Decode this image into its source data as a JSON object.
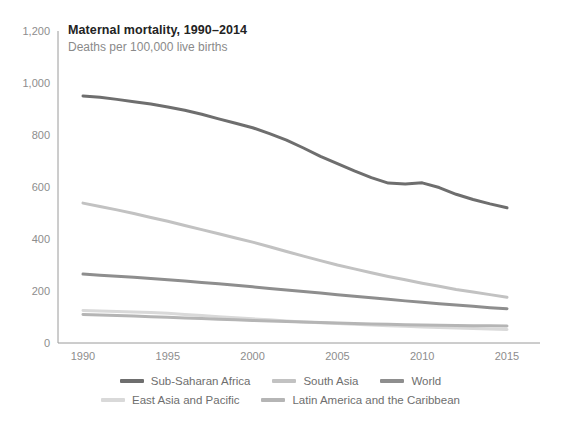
{
  "chart_data": {
    "type": "line",
    "title": "Maternal mortality, 1990–2014",
    "subtitle": "Deaths per 100,000 live births",
    "xlabel": "",
    "ylabel": "",
    "xlim": [
      1990,
      2015
    ],
    "ylim": [
      0,
      1200
    ],
    "grid": false,
    "legend_position": "bottom",
    "x_ticks": [
      "1990",
      "1995",
      "2000",
      "2005",
      "2010",
      "2015"
    ],
    "x_tick_values": [
      1990,
      1995,
      2000,
      2005,
      2010,
      2015
    ],
    "y_ticks": [
      "0",
      "200",
      "400",
      "600",
      "800",
      "1,000",
      "1,200"
    ],
    "y_tick_values": [
      0,
      200,
      400,
      600,
      800,
      1000,
      1200
    ],
    "x": [
      1990,
      1991,
      1992,
      1993,
      1994,
      1995,
      1996,
      1997,
      1998,
      1999,
      2000,
      2001,
      2002,
      2003,
      2004,
      2005,
      2006,
      2007,
      2008,
      2009,
      2010,
      2011,
      2012,
      2013,
      2014,
      2015
    ],
    "series": [
      {
        "name": "Sub-Saharan Africa",
        "color": "#6e6e6e",
        "values": [
          950,
          945,
          937,
          928,
          919,
          908,
          895,
          880,
          862,
          845,
          828,
          805,
          780,
          750,
          718,
          690,
          662,
          636,
          615,
          612,
          616,
          598,
          572,
          552,
          535,
          520
        ]
      },
      {
        "name": "South Asia",
        "color": "#c2c2c2",
        "values": [
          538,
          525,
          512,
          498,
          483,
          468,
          452,
          436,
          420,
          404,
          388,
          370,
          352,
          334,
          317,
          300,
          285,
          270,
          256,
          243,
          230,
          218,
          206,
          196,
          186,
          176
        ]
      },
      {
        "name": "World",
        "color": "#8e8e8e",
        "values": [
          265,
          261,
          257,
          253,
          248,
          243,
          238,
          233,
          228,
          222,
          216,
          210,
          204,
          198,
          192,
          186,
          180,
          174,
          168,
          162,
          157,
          151,
          146,
          141,
          136,
          132
        ]
      },
      {
        "name": "East Asia and Pacific",
        "color": "#d9d9d9",
        "values": [
          125,
          123,
          121,
          119,
          117,
          114,
          110,
          106,
          101,
          97,
          93,
          89,
          85,
          81,
          78,
          75,
          72,
          69,
          66,
          64,
          62,
          60,
          58,
          56,
          54,
          52
        ]
      },
      {
        "name": "Latin America and the Caribbean",
        "color": "#b5b5b5",
        "values": [
          110,
          108,
          106,
          104,
          101,
          99,
          96,
          94,
          91,
          89,
          87,
          85,
          83,
          81,
          79,
          77,
          75,
          73,
          72,
          70,
          69,
          68,
          67,
          66,
          66,
          65
        ]
      }
    ]
  },
  "axis": {
    "line_color": "#9a9a9a"
  },
  "legend": {
    "row1": [
      {
        "label": "Sub-Saharan Africa",
        "color": "#6e6e6e"
      },
      {
        "label": "South Asia",
        "color": "#c2c2c2"
      },
      {
        "label": "World",
        "color": "#8e8e8e"
      }
    ],
    "row2": [
      {
        "label": "East Asia and Pacific",
        "color": "#d9d9d9"
      },
      {
        "label": "Latin America and the Caribbean",
        "color": "#b5b5b5"
      }
    ]
  }
}
